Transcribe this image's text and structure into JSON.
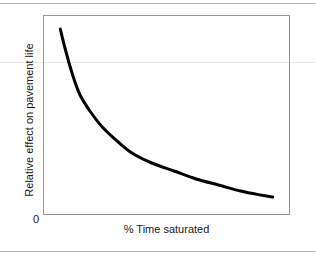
{
  "chart_data": {
    "type": "line",
    "title": "",
    "subtitle": "",
    "xlabel": "% Time saturated",
    "ylabel": "Relative effect on pavement life",
    "origin_label": "0",
    "grid": false,
    "legend": null,
    "axis_ticks": {
      "x": [],
      "y": []
    },
    "xlim": [
      0,
      100
    ],
    "ylim": [
      0,
      100
    ],
    "annotations": [],
    "series": [
      {
        "name": "Relative effect on pavement life",
        "color": "#000000",
        "line_width": 3,
        "x": [
          7,
          9,
          12,
          15,
          19,
          24,
          30,
          36,
          44,
          53,
          62,
          71,
          80,
          88,
          93
        ],
        "y": [
          93,
          83,
          70,
          60,
          52,
          44,
          37,
          31,
          26,
          22,
          18,
          15,
          12,
          10,
          9
        ]
      }
    ]
  },
  "figure": {
    "ylabel": "Relative effect on pavement life",
    "xlabel": "% Time saturated",
    "origin": "0"
  },
  "colors": {
    "curve": "#000000",
    "frame": "#999999",
    "rule": "#b8b8b8",
    "artifact_rule": "#e9e9e9",
    "background": "#ffffff",
    "text": "#1a1a1a"
  }
}
